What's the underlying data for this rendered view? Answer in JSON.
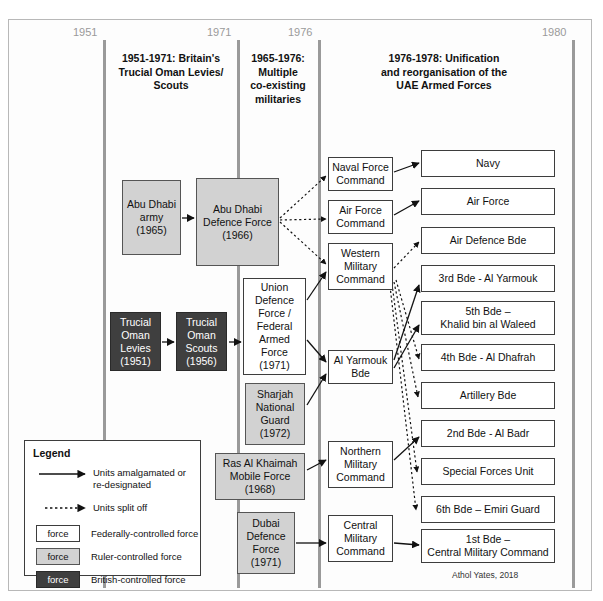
{
  "figure": {
    "credit": "Athol Yates, 2018"
  },
  "timeline": {
    "years": [
      {
        "label": "1951",
        "x": 103
      },
      {
        "label": "1971",
        "x": 237
      },
      {
        "label": "1976",
        "x": 318
      },
      {
        "label": "1980",
        "x": 572
      }
    ],
    "eras": [
      {
        "title": "1951-1971: Britain's\nTrucial Oman Levies/\nScouts",
        "x": 108,
        "y": 52,
        "w": 126
      },
      {
        "title": "1965-1976:\nMultiple\nco-existing\nmilitaries",
        "x": 241,
        "y": 52,
        "w": 74
      },
      {
        "title": "1976-1978: Unification\nand reorganisation of the\nUAE Armed Forces",
        "x": 340,
        "y": 52,
        "w": 208
      }
    ]
  },
  "nodes": {
    "abu_dhabi_army": {
      "label": "Abu Dhabi\narmy\n(1965)",
      "type": "ruler",
      "x": 122,
      "y": 180,
      "w": 59,
      "h": 75
    },
    "abu_dhabi_defence_force": {
      "label": "Abu Dhabi\nDefence Force\n(1966)",
      "type": "ruler",
      "x": 196,
      "y": 178,
      "w": 83,
      "h": 88
    },
    "trucial_oman_levies": {
      "label": "Trucial\nOman\nLevies\n(1951)",
      "type": "british",
      "x": 110,
      "y": 312,
      "w": 51,
      "h": 59
    },
    "trucial_oman_scouts": {
      "label": "Trucial\nOman\nScouts\n(1956)",
      "type": "british",
      "x": 176,
      "y": 312,
      "w": 51,
      "h": 59
    },
    "union_defence_force": {
      "label": "Union\nDefence\nForce /\nFederal\nArmed Force\n(1971)",
      "type": "federal",
      "x": 243,
      "y": 278,
      "w": 63,
      "h": 97
    },
    "sharjah_national_guard": {
      "label": "Sharjah\nNational\nGuard\n(1972)",
      "type": "ruler",
      "x": 245,
      "y": 383,
      "w": 60,
      "h": 62
    },
    "ras_al_khaimah_mobile_force": {
      "label": "Ras Al Khaimah\nMobile Force\n(1968)",
      "type": "ruler",
      "x": 215,
      "y": 453,
      "w": 90,
      "h": 47
    },
    "dubai_defence_force": {
      "label": "Dubai\nDefence\nForce\n(1971)",
      "type": "ruler",
      "x": 237,
      "y": 512,
      "w": 58,
      "h": 62
    },
    "naval_force_command": {
      "label": "Naval Force\nCommand",
      "type": "federal",
      "x": 328,
      "y": 157,
      "w": 65,
      "h": 34
    },
    "air_force_command": {
      "label": "Air Force\nCommand",
      "type": "federal",
      "x": 328,
      "y": 200,
      "w": 65,
      "h": 34
    },
    "western_military_command": {
      "label": "Western\nMilitary\nCommand",
      "type": "federal",
      "x": 328,
      "y": 243,
      "w": 65,
      "h": 47
    },
    "al_yarmouk_bde": {
      "label": "Al Yarmouk\nBde",
      "type": "federal",
      "x": 328,
      "y": 350,
      "w": 65,
      "h": 34
    },
    "northern_military_command": {
      "label": "Northern\nMilitary\nCommand",
      "type": "federal",
      "x": 328,
      "y": 441,
      "w": 65,
      "h": 47
    },
    "central_military_command": {
      "label": "Central\nMilitary\nCommand",
      "type": "federal",
      "x": 328,
      "y": 515,
      "w": 65,
      "h": 47
    },
    "navy": {
      "label": "Navy",
      "type": "federal",
      "x": 421,
      "y": 150,
      "w": 134,
      "h": 27
    },
    "air_force": {
      "label": "Air Force",
      "type": "federal",
      "x": 421,
      "y": 188,
      "w": 134,
      "h": 27
    },
    "air_defence_bde": {
      "label": "Air Defence Bde",
      "type": "federal",
      "x": 421,
      "y": 227,
      "w": 134,
      "h": 27
    },
    "third_bde": {
      "label": "3rd Bde - Al Yarmouk",
      "type": "federal",
      "x": 421,
      "y": 265,
      "w": 134,
      "h": 27
    },
    "fifth_bde": {
      "label": "5th Bde –\nKhalid bin al Waleed",
      "type": "federal",
      "x": 421,
      "y": 303,
      "w": 134,
      "h": 33
    },
    "fourth_bde": {
      "label": "4th Bde - Al Dhafrah",
      "type": "federal",
      "x": 421,
      "y": 345,
      "w": 134,
      "h": 27
    },
    "artillery_bde": {
      "label": "Artillery Bde",
      "type": "federal",
      "x": 421,
      "y": 383,
      "w": 134,
      "h": 27
    },
    "second_bde": {
      "label": "2nd Bde - Al Badr",
      "type": "federal",
      "x": 421,
      "y": 421,
      "w": 134,
      "h": 27
    },
    "special_forces_unit": {
      "label": "Special Forces Unit",
      "type": "federal",
      "x": 421,
      "y": 459,
      "w": 134,
      "h": 27
    },
    "sixth_bde": {
      "label": "6th Bde – Emiri Guard",
      "type": "federal",
      "x": 421,
      "y": 497,
      "w": 134,
      "h": 27
    },
    "first_bde": {
      "label": "1st Bde –\nCentral Military Command",
      "type": "federal",
      "x": 421,
      "y": 529,
      "w": 134,
      "h": 33
    }
  },
  "legend": {
    "title": "Legend",
    "items": [
      {
        "kind": "solid-arrow",
        "text": "Units amalgamated or\nre-designated"
      },
      {
        "kind": "dotted-arrow",
        "text": "Units split off"
      },
      {
        "kind": "swatch",
        "swatch_type": "federal",
        "swatch_label": "force",
        "text": "Federally-controlled force"
      },
      {
        "kind": "swatch",
        "swatch_type": "ruler",
        "swatch_label": "force",
        "text": "Ruler-controlled force"
      },
      {
        "kind": "swatch",
        "swatch_type": "british",
        "swatch_label": "force",
        "text": "British-controlled force"
      }
    ]
  },
  "colors": {
    "federal_fill": "#ffffff",
    "ruler_fill": "#d2d2d2",
    "british_fill": "#3f3f3f",
    "line": "#9a9a9a",
    "stroke": "#3d3d3d"
  }
}
